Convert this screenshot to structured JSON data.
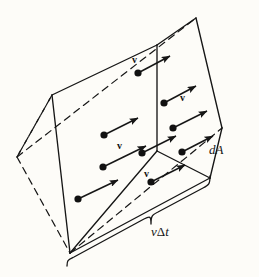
{
  "figure": {
    "kind": "physics-flux-volume-element",
    "background_color": "#fdfcf8",
    "ink_color": "#161616",
    "width": 259,
    "height": 277,
    "labels": {
      "area_label": "dA",
      "length_label_speed": "v",
      "length_label_delta": "Δ",
      "length_label_time": "t",
      "length_label_full": "vΔt"
    },
    "velocity_labels": [
      {
        "id": "v-1",
        "text": "v",
        "x": 133,
        "y": 62
      },
      {
        "id": "v-2",
        "text": "v",
        "x": 180,
        "y": 100
      },
      {
        "id": "v-3",
        "text": "v",
        "x": 118,
        "y": 148
      },
      {
        "id": "v-4",
        "text": "v",
        "x": 144,
        "y": 176
      }
    ],
    "particles": [
      {
        "id": "particle-1",
        "x": 138,
        "y": 73,
        "arrow_dx": 34,
        "arrow_dy": -18
      },
      {
        "id": "particle-2",
        "x": 164,
        "y": 103,
        "arrow_dx": 34,
        "arrow_dy": -18
      },
      {
        "id": "particle-3",
        "x": 104,
        "y": 135,
        "arrow_dx": 34,
        "arrow_dy": -18
      },
      {
        "id": "particle-4",
        "x": 173,
        "y": 128,
        "arrow_dx": 34,
        "arrow_dy": -18
      },
      {
        "id": "particle-5",
        "x": 142,
        "y": 153,
        "arrow_dx": 34,
        "arrow_dy": -18
      },
      {
        "id": "particle-6",
        "x": 182,
        "y": 152,
        "arrow_dx": 34,
        "arrow_dy": -18
      },
      {
        "id": "particle-7",
        "x": 103,
        "y": 167,
        "arrow_dx": 34,
        "arrow_dy": -18
      },
      {
        "id": "particle-8",
        "x": 151,
        "y": 182,
        "arrow_dx": 34,
        "arrow_dy": -18
      },
      {
        "id": "particle-9",
        "x": 78,
        "y": 199,
        "arrow_dx": 34,
        "arrow_dy": -18
      }
    ],
    "geometry": {
      "note": "Parallelepiped drawn in oblique projection; right face is the area element dA, the long edge is vΔt",
      "vertices": {
        "front_top_right": [
          196,
          18
        ],
        "front_right": [
          222,
          128
        ],
        "front_bottom_right": [
          210,
          178
        ],
        "front_bottom_left": [
          70,
          253
        ],
        "back_top_left": [
          52,
          95
        ],
        "left": [
          17,
          157
        ],
        "front_left_upper": [
          52,
          95
        ],
        "inner_edge_top": [
          157,
          45
        ]
      }
    }
  }
}
